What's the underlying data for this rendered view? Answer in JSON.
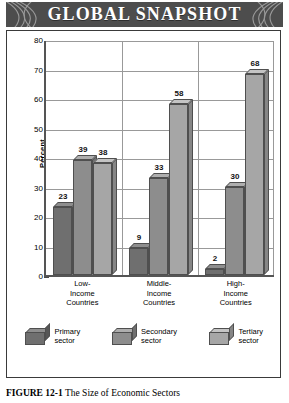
{
  "banner": {
    "title": "GLOBAL SNAPSHOT"
  },
  "caption": {
    "figure_number": "FIGURE 12-1",
    "text": "The Size of Economic Sectors"
  },
  "colors": {
    "banner_bg": "#4d4d4d",
    "primary_sector": "#6f6f6f",
    "secondary_sector": "#8d8d8d",
    "tertiary_sector": "#a6a6a6",
    "frame_border": "#3a3a3a",
    "gridline": "#999999"
  },
  "chart_data": {
    "type": "bar",
    "title": "GLOBAL SNAPSHOT",
    "xlabel": "",
    "ylabel": "Percent",
    "ylim": [
      0,
      80
    ],
    "yticks": [
      0,
      10,
      20,
      30,
      40,
      50,
      60,
      70,
      80
    ],
    "grid": true,
    "legend_position": "bottom",
    "categories": [
      "Low-\nIncome\nCountries",
      "Middle-\nIncome\nCountries",
      "High-\nIncome\nCountries"
    ],
    "category_lines": [
      [
        "Low-",
        "Income",
        "Countries"
      ],
      [
        "Middle-",
        "Income",
        "Countries"
      ],
      [
        "High-",
        "Income",
        "Countries"
      ]
    ],
    "series": [
      {
        "name": "Primary sector",
        "values": [
          23,
          9,
          2
        ]
      },
      {
        "name": "Secondary sector",
        "values": [
          39,
          33,
          30
        ]
      },
      {
        "name": "Tertiary sector",
        "values": [
          38,
          58,
          68
        ]
      }
    ],
    "legend": [
      {
        "line1": "Primary",
        "line2": "sector"
      },
      {
        "line1": "Secondary",
        "line2": "sector"
      },
      {
        "line1": "Tertiary",
        "line2": "sector"
      }
    ]
  }
}
